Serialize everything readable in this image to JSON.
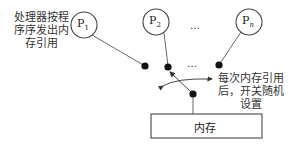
{
  "processors": [
    {
      "id": "P1",
      "label": "P",
      "sub": "1"
    },
    {
      "id": "P2",
      "label": "P",
      "sub": "2"
    },
    {
      "id": "Pn",
      "label": "P",
      "sub": "n"
    }
  ],
  "ellipsis": "…",
  "annotations": {
    "left": [
      "处理器按程",
      "序序发出内",
      "存引用"
    ],
    "right": [
      "每次内存引用",
      "后，开关随机",
      "设置"
    ]
  },
  "memory": {
    "label": "内存"
  },
  "colors": {
    "stroke": "#444444",
    "dot": "#111111",
    "text": "#222222"
  }
}
